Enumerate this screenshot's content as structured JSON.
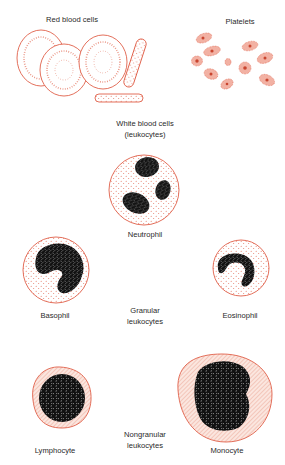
{
  "colors": {
    "outline": "#e0604a",
    "stipple": "#e88a78",
    "fill_light": "#fbe3dc",
    "hatch": "#eda394",
    "nucleus": "#111111"
  },
  "labels": {
    "red_blood_cells": "Red blood cells",
    "platelets": "Platelets",
    "white_blood_cells_line1": "White blood cells",
    "white_blood_cells_line2": "(leukocytes)",
    "neutrophil": "Neutrophil",
    "basophil": "Basophil",
    "eosinophil": "Eosinophil",
    "granular_line1": "Granular",
    "granular_line2": "leukocytes",
    "lymphocyte": "Lymphocyte",
    "nongranular_line1": "Nongranular",
    "nongranular_line2": "leukocytes",
    "monocyte": "Monocyte"
  },
  "groups": {
    "granular_leukocytes": [
      "Neutrophil",
      "Basophil",
      "Eosinophil"
    ],
    "nongranular_leukocytes": [
      "Lymphocyte",
      "Monocyte"
    ]
  }
}
